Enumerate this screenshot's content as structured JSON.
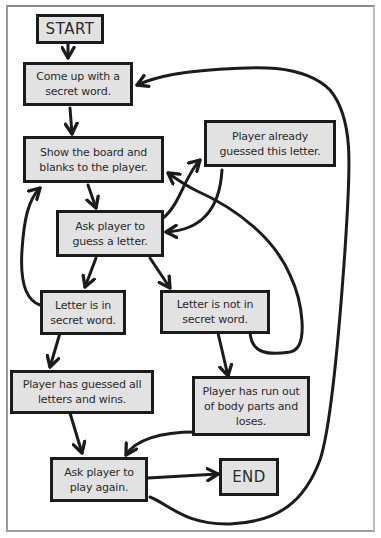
{
  "diagram": {
    "type": "flowchart",
    "colors": {
      "box_fill": "#e2e2e2",
      "stroke": "#1b1b1b",
      "text": "#2a2a2a",
      "background": "#ffffff"
    },
    "nodes": {
      "start": {
        "label": "START"
      },
      "secret_word": {
        "label": "Come up with a secret word."
      },
      "show_board": {
        "label": "Show the board and blanks to the player."
      },
      "already_guessed": {
        "label": "Player already guessed this letter."
      },
      "ask_letter": {
        "label": "Ask player to guess a letter."
      },
      "letter_in": {
        "label": "Letter is in secret word."
      },
      "letter_not_in": {
        "label": "Letter is not in secret word."
      },
      "player_wins": {
        "label": "Player has guessed all letters and wins."
      },
      "player_loses": {
        "label": "Player has run out of body parts and loses."
      },
      "play_again": {
        "label": "Ask player to play again."
      },
      "end": {
        "label": "END"
      }
    },
    "edges": [
      {
        "from": "START",
        "to": "Come up with a secret word."
      },
      {
        "from": "Come up with a secret word.",
        "to": "Show the board and blanks to the player."
      },
      {
        "from": "Show the board and blanks to the player.",
        "to": "Ask player to guess a letter."
      },
      {
        "from": "Ask player to guess a letter.",
        "to": "Player already guessed this letter."
      },
      {
        "from": "Player already guessed this letter.",
        "to": "Ask player to guess a letter."
      },
      {
        "from": "Ask player to guess a letter.",
        "to": "Letter is in secret word."
      },
      {
        "from": "Ask player to guess a letter.",
        "to": "Letter is not in secret word."
      },
      {
        "from": "Letter is in secret word.",
        "to": "Show the board and blanks to the player."
      },
      {
        "from": "Letter is not in secret word.",
        "to": "Show the board and blanks to the player."
      },
      {
        "from": "Letter is in secret word.",
        "to": "Player has guessed all letters and wins."
      },
      {
        "from": "Letter is not in secret word.",
        "to": "Player has run out of body parts and loses."
      },
      {
        "from": "Player has guessed all letters and wins.",
        "to": "Ask player to play again."
      },
      {
        "from": "Player has run out of body parts and loses.",
        "to": "Ask player to play again."
      },
      {
        "from": "Ask player to play again.",
        "to": "END"
      },
      {
        "from": "Ask player to play again.",
        "to": "Come up with a secret word."
      }
    ]
  }
}
